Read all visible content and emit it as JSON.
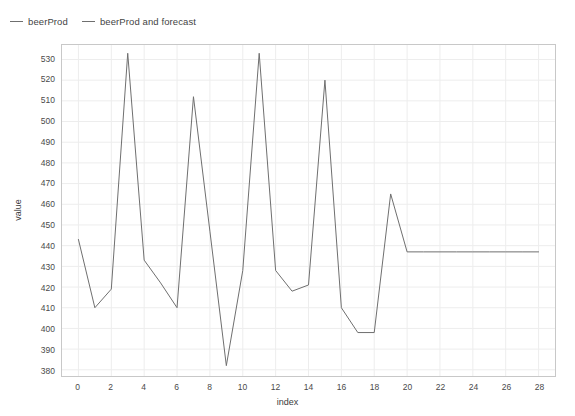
{
  "legend": {
    "position": "top-left",
    "entries": [
      {
        "label": "beerProd",
        "color": "#6f6f6f"
      },
      {
        "label": "beerProd and forecast",
        "color": "#6f6f6f"
      }
    ]
  },
  "chart_data": {
    "type": "line",
    "title": "",
    "xlabel": "index",
    "ylabel": "value",
    "xlim": [
      -1,
      29
    ],
    "ylim": [
      377,
      537
    ],
    "grid": true,
    "xticks": [
      0,
      2,
      4,
      6,
      8,
      10,
      12,
      14,
      16,
      18,
      20,
      22,
      24,
      26,
      28
    ],
    "yticks": [
      380,
      390,
      400,
      410,
      420,
      430,
      440,
      450,
      460,
      470,
      480,
      490,
      500,
      510,
      520,
      530
    ],
    "x": [
      0,
      1,
      2,
      3,
      4,
      5,
      6,
      7,
      8,
      9,
      10,
      11,
      12,
      13,
      14,
      15,
      16,
      17,
      18,
      19,
      20,
      21,
      22,
      23,
      24,
      25,
      26,
      27,
      28
    ],
    "series": [
      {
        "name": "beerProd and forecast",
        "color": "#6f6f6f",
        "linewidth": 1,
        "values": [
          443,
          410,
          419,
          533,
          433,
          422,
          410,
          512,
          447,
          382,
          428,
          533,
          428,
          418,
          421,
          520,
          410,
          398,
          398,
          465,
          437,
          437,
          437,
          437,
          437,
          437,
          437,
          437,
          437
        ]
      }
    ]
  },
  "axes": {
    "x_tick_text": [
      "0",
      "2",
      "4",
      "6",
      "8",
      "10",
      "12",
      "14",
      "16",
      "18",
      "20",
      "22",
      "24",
      "26",
      "28"
    ],
    "y_tick_text": [
      "380",
      "390",
      "400",
      "410",
      "420",
      "430",
      "440",
      "450",
      "460",
      "470",
      "480",
      "490",
      "500",
      "510",
      "520",
      "530"
    ],
    "x_title": "index",
    "y_title": "value"
  }
}
